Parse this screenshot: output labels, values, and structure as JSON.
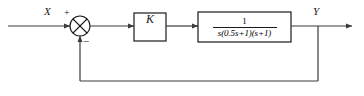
{
  "diagram": {
    "type": "control-system-block-diagram",
    "background_color": "#ffffff",
    "line_color": "#3a3a3a",
    "text_color": "#1a1a1a"
  },
  "signals": {
    "input_label": "X",
    "output_label": "Y"
  },
  "summing_junction": {
    "name": "summing-junction",
    "shape": "circle-with-cross",
    "plus_sign": "+",
    "minus_sign": "−",
    "center_x": 80,
    "center_y": 26,
    "radius": 10
  },
  "blocks": [
    {
      "name": "gain-block",
      "label": "K",
      "x": 134,
      "y": 13,
      "width": 32,
      "height": 28
    },
    {
      "name": "transfer-function-block",
      "numerator": "1",
      "denominator": "s(0.5s+1)(s+1)",
      "expression": "1 / (s(0.5s+1)(s+1))",
      "x": 198,
      "y": 12,
      "width": 93,
      "height": 30
    }
  ],
  "feedback": {
    "name": "feedback-path",
    "type": "unity",
    "sign": "negative",
    "tap_x": 318,
    "bottom_y": 81,
    "return_x": 80
  }
}
